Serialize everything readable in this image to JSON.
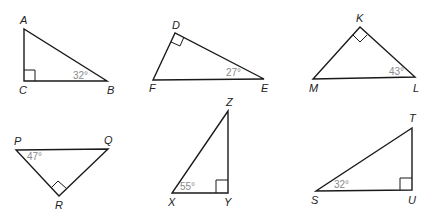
{
  "figure": {
    "triangles": [
      {
        "id": "ABC",
        "vertices": {
          "A": "A",
          "C": "C",
          "B": "B"
        },
        "right_angle_at": "C",
        "angle_label": "32°",
        "angle_at": "B"
      },
      {
        "id": "DEF",
        "vertices": {
          "D": "D",
          "F": "F",
          "E": "E"
        },
        "right_angle_at": "D",
        "angle_label": "27°",
        "angle_at": "E"
      },
      {
        "id": "KML",
        "vertices": {
          "K": "K",
          "M": "M",
          "L": "L"
        },
        "right_angle_at": "K",
        "angle_label": "43°",
        "angle_at": "L"
      },
      {
        "id": "PQR",
        "vertices": {
          "P": "P",
          "Q": "Q",
          "R": "R"
        },
        "right_angle_at": "R",
        "angle_label": "47°",
        "angle_at": "P"
      },
      {
        "id": "XYZ",
        "vertices": {
          "Z": "Z",
          "X": "X",
          "Y": "Y"
        },
        "right_angle_at": "Y",
        "angle_label": "55°",
        "angle_at": "X"
      },
      {
        "id": "STU",
        "vertices": {
          "T": "T",
          "S": "S",
          "U": "U"
        },
        "right_angle_at": "U",
        "angle_label": "32°",
        "angle_at": "S"
      }
    ]
  }
}
